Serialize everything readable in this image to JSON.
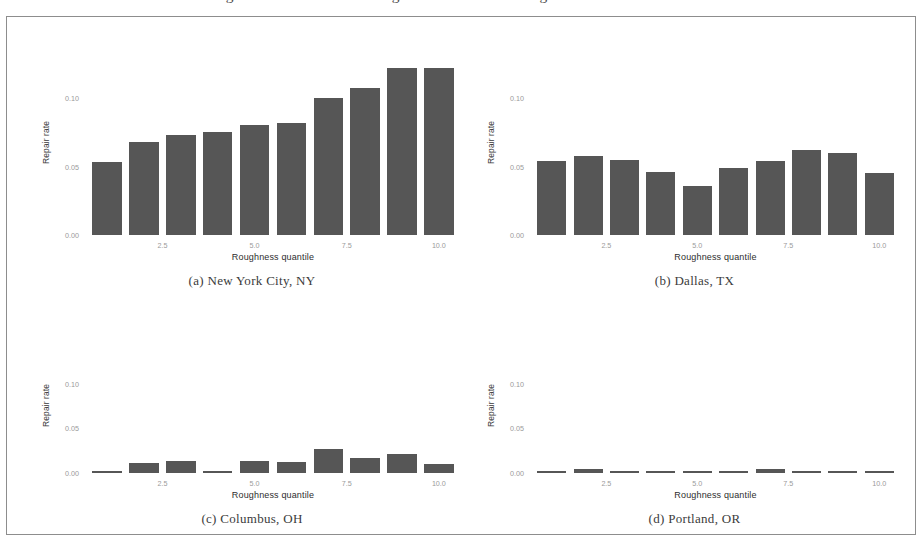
{
  "figure": {
    "title": "Figure 13: Local Road Roughness and Resurfacing Decisions in Four Cities"
  },
  "axis": {
    "ylabel": "Repair rate",
    "xlabel": "Roughness quantile",
    "yticks": [
      "0.00",
      "0.05",
      "0.10"
    ],
    "xticks": [
      "2.5",
      "5.0",
      "7.5",
      "10.0"
    ]
  },
  "captions": {
    "a": "(a) New York City, NY",
    "b": "(b) Dallas, TX",
    "c": "(c) Columbus, OH",
    "d": "(d) Portland, OR"
  },
  "colors": {
    "bar": "#565656",
    "frame": "#8d8d8d",
    "tick_text": "#9a9a9a",
    "axis_text": "#2e2e2e",
    "title_text": "#4a4a4a"
  },
  "chart_data": [
    {
      "type": "bar",
      "panel": "a",
      "title": "(a) New York City, NY",
      "xlabel": "Roughness quantile",
      "ylabel": "Repair rate",
      "categories": [
        1,
        2,
        3,
        4,
        5,
        6,
        7,
        8,
        9,
        10
      ],
      "values": [
        0.053,
        0.068,
        0.073,
        0.075,
        0.08,
        0.082,
        0.1,
        0.107,
        0.122,
        0.122
      ],
      "ylim": [
        0.0,
        0.13
      ],
      "xlim": [
        0.4,
        10.6
      ],
      "ytick_values": [
        0.0,
        0.05,
        0.1
      ],
      "xtick_values": [
        2.5,
        5.0,
        7.5,
        10.0
      ],
      "grid": false,
      "legend": "none"
    },
    {
      "type": "bar",
      "panel": "b",
      "title": "(b) Dallas, TX",
      "xlabel": "Roughness quantile",
      "ylabel": "Repair rate",
      "categories": [
        1,
        2,
        3,
        4,
        5,
        6,
        7,
        8,
        9,
        10
      ],
      "values": [
        0.054,
        0.058,
        0.055,
        0.046,
        0.036,
        0.049,
        0.054,
        0.062,
        0.06,
        0.045
      ],
      "ylim": [
        0.0,
        0.13
      ],
      "xlim": [
        0.4,
        10.6
      ],
      "ytick_values": [
        0.0,
        0.05,
        0.1
      ],
      "xtick_values": [
        2.5,
        5.0,
        7.5,
        10.0
      ],
      "grid": false,
      "legend": "none"
    },
    {
      "type": "bar",
      "panel": "c",
      "title": "(c) Columbus, OH",
      "xlabel": "Roughness quantile",
      "ylabel": "Repair rate",
      "categories": [
        1,
        2,
        3,
        4,
        5,
        6,
        7,
        8,
        9,
        10
      ],
      "values": [
        0.001,
        0.011,
        0.014,
        0.002,
        0.014,
        0.012,
        0.027,
        0.017,
        0.021,
        0.01
      ],
      "ylim": [
        0.0,
        0.13
      ],
      "xlim": [
        0.4,
        10.6
      ],
      "ytick_values": [
        0.0,
        0.05,
        0.1
      ],
      "xtick_values": [
        2.5,
        5.0,
        7.5,
        10.0
      ],
      "grid": false,
      "legend": "none"
    },
    {
      "type": "bar",
      "panel": "d",
      "title": "(d) Portland, OR",
      "xlabel": "Roughness quantile",
      "ylabel": "Repair rate",
      "categories": [
        1,
        2,
        3,
        4,
        5,
        6,
        7,
        8,
        9,
        10
      ],
      "values": [
        0.0015,
        0.0045,
        0.0018,
        0.0018,
        0.0016,
        0.0014,
        0.0048,
        0.0014,
        0.0022,
        0.0024
      ],
      "ylim": [
        0.0,
        0.13
      ],
      "xlim": [
        0.4,
        10.6
      ],
      "ytick_values": [
        0.0,
        0.05,
        0.1
      ],
      "xtick_values": [
        2.5,
        5.0,
        7.5,
        10.0
      ],
      "grid": false,
      "legend": "none"
    }
  ]
}
